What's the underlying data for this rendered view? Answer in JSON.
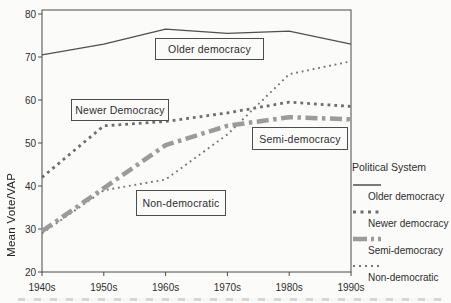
{
  "figure": {
    "y_axis_title": "Mean Vote/VAP",
    "legend_title": "Political System",
    "background_color": "#fbfbf9",
    "frame_color": "#4a4a4a",
    "text_color": "#2e2e2e"
  },
  "chart_data": {
    "type": "line",
    "categories": [
      "1940s",
      "1950s",
      "1960s",
      "1970s",
      "1980s",
      "1990s"
    ],
    "y_ticks": [
      80,
      70,
      60,
      50,
      40,
      30,
      20
    ],
    "ylim": [
      20,
      80
    ],
    "xlabel": "",
    "ylabel": "Mean Vote/VAP",
    "grid": false,
    "legend_title": "Political System",
    "legend_position": "right",
    "series": [
      {
        "name": "Older democracy",
        "values": [
          70.5,
          73,
          76.5,
          75.5,
          76,
          73
        ],
        "line_style": "solid",
        "color": "#4f4f4f"
      },
      {
        "name": "Newer democracy",
        "values": [
          42,
          54,
          55,
          57,
          59.5,
          58.5
        ],
        "line_style": "square-dotted",
        "color": "#6e6e6e"
      },
      {
        "name": "Semi-democracy",
        "values": [
          29.5,
          39.5,
          49.5,
          54,
          56,
          55.5
        ],
        "line_style": "thick-dash-dot",
        "color": "#9b9b9b"
      },
      {
        "name": "Non-democratic",
        "values": [
          29,
          39,
          41.5,
          52,
          66,
          69
        ],
        "line_style": "fine-dotted",
        "color": "#757575"
      }
    ],
    "annotations": [
      {
        "text": "Older democracy",
        "series": "Older democracy"
      },
      {
        "text": "Newer Democracy",
        "series": "Newer democracy"
      },
      {
        "text": "Semi-democracy",
        "series": "Semi-democracy"
      },
      {
        "text": "Non-democratic",
        "series": "Non-democratic"
      }
    ]
  }
}
